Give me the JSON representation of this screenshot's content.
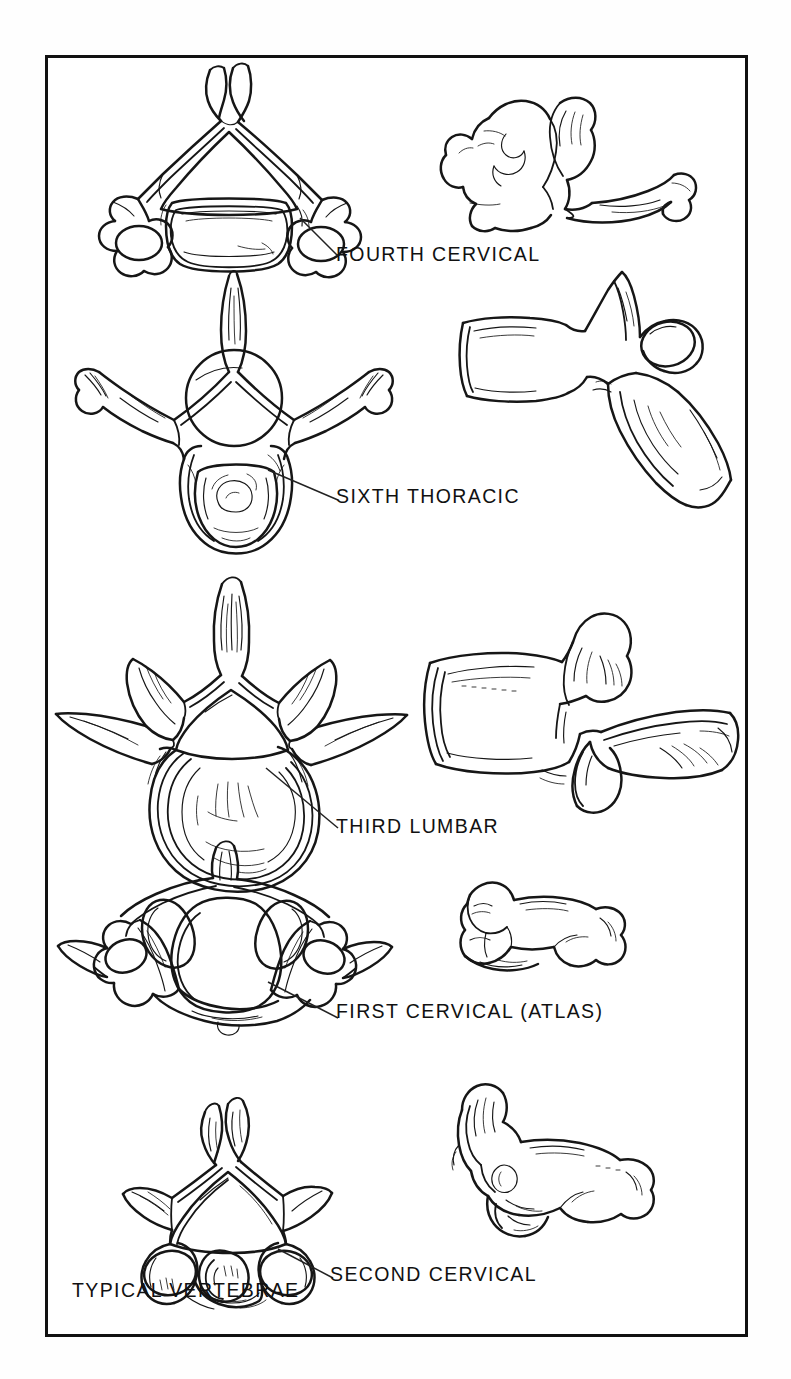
{
  "plate": {
    "title": "TYPICAL VERTEBRAE",
    "border_color": "#111111",
    "ink_color": "#161616",
    "background": "#ffffff",
    "view_note_left": "superior view",
    "view_note_right": "lateral view"
  },
  "labels": {
    "fourth_cervical": "FOURTH CERVICAL",
    "sixth_thoracic": "SIXTH THORACIC",
    "third_lumbar": "THIRD LUMBAR",
    "first_cervical": "FIRST CERVICAL (ATLAS)",
    "second_cervical": "SECOND CERVICAL",
    "typical_vertebrae": "TYPICAL VERTEBRAE"
  },
  "specimens": [
    {
      "id": "fourth-cervical",
      "label": "FOURTH CERVICAL",
      "region": "cervical",
      "ordinal": "fourth",
      "views": [
        "superior",
        "lateral"
      ]
    },
    {
      "id": "sixth-thoracic",
      "label": "SIXTH THORACIC",
      "region": "thoracic",
      "ordinal": "sixth",
      "views": [
        "superior",
        "lateral"
      ]
    },
    {
      "id": "third-lumbar",
      "label": "THIRD LUMBAR",
      "region": "lumbar",
      "ordinal": "third",
      "views": [
        "superior",
        "lateral"
      ]
    },
    {
      "id": "first-cervical",
      "label": "FIRST CERVICAL (ATLAS)",
      "region": "cervical",
      "ordinal": "first",
      "views": [
        "superior",
        "lateral"
      ]
    },
    {
      "id": "second-cervical",
      "label": "SECOND CERVICAL",
      "region": "cervical",
      "ordinal": "second",
      "views": [
        "superior",
        "lateral"
      ]
    }
  ]
}
